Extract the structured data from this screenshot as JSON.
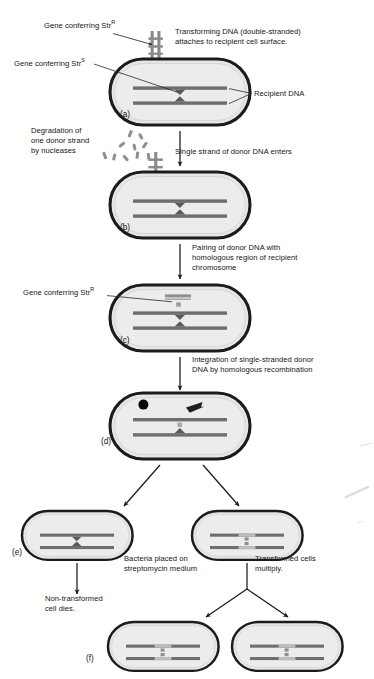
{
  "figure": {
    "type": "process-diagram"
  },
  "colors": {
    "cell_outline": "#1b1b1b",
    "cell_fill": "#e8e8e8",
    "cell_inner_fill": "#ececec",
    "dna_strand": "#6e6e6e",
    "donor_dna": "#8c8c8c",
    "integrated_segment": "#bdbdbd",
    "marker_dark": "#0a0a0a",
    "arrow": "#1a1a1a",
    "text": "#15151a",
    "background": "#ffffff"
  },
  "labels": {
    "gene_str_r_a": "Gene conferring Str",
    "gene_str_r_a_sup": "R",
    "gene_str_s_a": "Gene conferring Str",
    "gene_str_s_a_sup": "S",
    "recipient_dna": "Recipient DNA",
    "gene_str_r_c": "Gene conferring Str",
    "gene_str_r_c_sup": "R"
  },
  "steps": {
    "attach": "Transforming DNA (double-stranded)\nattaches to recipient cell surface.",
    "degradation": "Degradation of\none donor strand\nby nucleases",
    "single_strand_enters": "Single strand of donor DNA enters",
    "pairing": "Pairing of donor DNA with\nhomologous region of recipient\nchromosome",
    "integration": "Integration of single-stranded donor\nDNA by homologous recombination",
    "streptomycin": "Bacteria placed on\nstreptomycin medium",
    "multiply": "Transformed cells\nmultiply.",
    "non_transformed": "Non-transformed\ncell dies."
  },
  "stage_letters": {
    "a": "(a)",
    "b": "(b)",
    "c": "(c)",
    "d": "(d)",
    "e": "(e)",
    "f": "(f)"
  },
  "cells": [
    {
      "id": "a",
      "state": "recipient with attached double-stranded donor DNA"
    },
    {
      "id": "b",
      "state": "single donor strand entering, other strand degraded"
    },
    {
      "id": "c",
      "state": "donor strand paired with homologous region"
    },
    {
      "id": "d",
      "state": "integration by homologous recombination"
    },
    {
      "id": "e-left",
      "state": "non-transformed cell"
    },
    {
      "id": "e-right",
      "state": "transformed cell"
    },
    {
      "id": "f-left",
      "state": "transformed daughter cell"
    },
    {
      "id": "f-right",
      "state": "transformed daughter cell"
    }
  ]
}
